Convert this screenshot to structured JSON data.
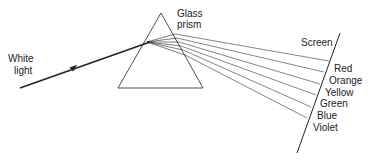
{
  "diagram": {
    "type": "prism-dispersion",
    "labels": {
      "white_light_line1": "White",
      "white_light_line2": "light",
      "prism_line1": "Glass",
      "prism_line2": "prism",
      "screen": "Screen"
    },
    "spectrum": [
      {
        "name": "Red"
      },
      {
        "name": "Orange"
      },
      {
        "name": "Yellow"
      },
      {
        "name": "Green"
      },
      {
        "name": "Blue"
      },
      {
        "name": "Violet"
      }
    ],
    "colors": {
      "stroke": "#222222",
      "background": "#ffffff"
    }
  }
}
